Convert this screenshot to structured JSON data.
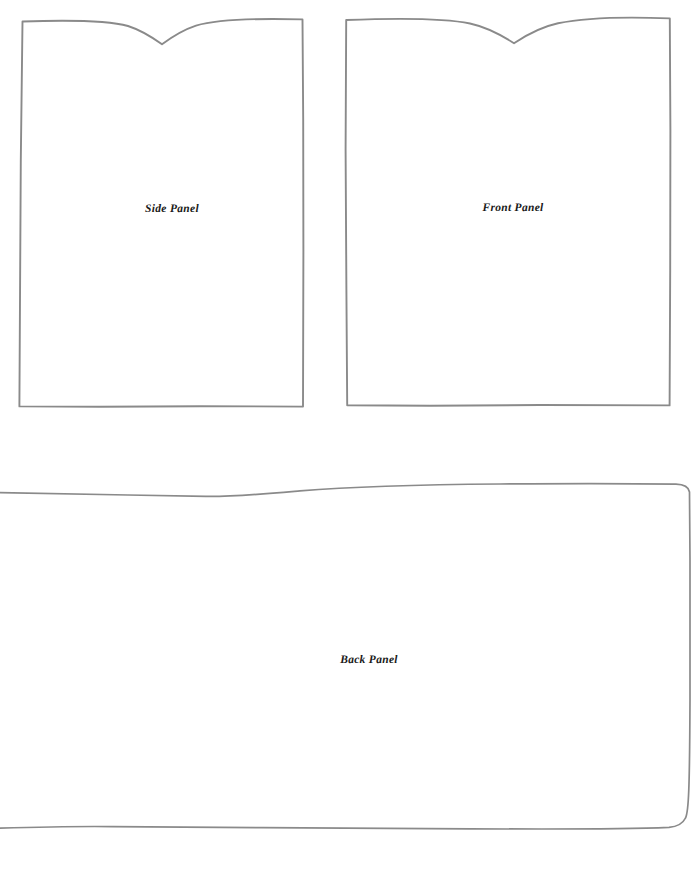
{
  "document": {
    "title": "Panel Pattern Sheet",
    "background_color": "#ffffff",
    "ink_color": "#8a8a8a",
    "label_color": "#1a1a1a",
    "width": 691,
    "height": 889
  },
  "panels": [
    {
      "id": "side-panel",
      "label": "Side Panel",
      "shape": "notched-rectangle",
      "label_x": 172,
      "label_y": 209,
      "bounds": {
        "left": 21,
        "top": 19,
        "right": 303,
        "bottom": 407
      },
      "notch": {
        "center_x": 162,
        "depth_y": 44,
        "shoulder_y": 22
      }
    },
    {
      "id": "front-panel",
      "label": "Front Panel",
      "shape": "notched-rectangle",
      "label_x": 513,
      "label_y": 208,
      "bounds": {
        "left": 346,
        "top": 18,
        "right": 670,
        "bottom": 406
      },
      "notch": {
        "center_x": 514,
        "depth_y": 43,
        "shoulder_y": 21
      }
    },
    {
      "id": "back-panel",
      "label": "Back Panel",
      "shape": "wide-rounded-rectangle-cropped-left",
      "label_x": 369,
      "label_y": 660,
      "bounds": {
        "left": -10,
        "top": 488,
        "right": 688,
        "bottom": 830
      },
      "notch": null
    }
  ]
}
